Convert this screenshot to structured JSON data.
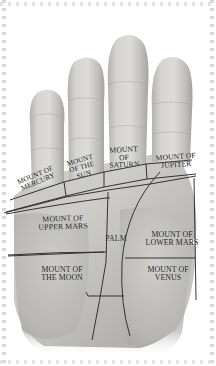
{
  "diagram": {
    "style": "grayscale photographic palm with labelled mount regions"
  },
  "colors": {
    "background": "#ffffff",
    "skin_light": "#d9d7d4",
    "skin_mid": "#bfbdba",
    "skin_shadow": "#a2a09d",
    "skin_deep": "#8c8a88",
    "line_stroke": "#2a2b30",
    "label_text": "#15161a",
    "frame_dot": "#d8d8dc"
  },
  "fingers": [
    {
      "name": "little-finger",
      "label": "pinky"
    },
    {
      "name": "ring-finger",
      "label": "ring"
    },
    {
      "name": "middle-finger",
      "label": "middle"
    },
    {
      "name": "index-finger",
      "label": "index"
    }
  ],
  "regions": [
    {
      "id": "mount-of-mercury",
      "label": "MOUNT OF\nMERCURY",
      "x": 8,
      "y": 172,
      "width": 58,
      "height": 26,
      "rotate": -23,
      "font_size": 7.2
    },
    {
      "id": "mount-of-the-sun",
      "label": "MOUNT\nOF THE\nSUN",
      "x": 62,
      "y": 157,
      "width": 40,
      "height": 36,
      "rotate": -16,
      "font_size": 7.2
    },
    {
      "id": "mount-of-saturn",
      "label": "MOUNT\nOF\nSATURN",
      "x": 102,
      "y": 146,
      "width": 44,
      "height": 38,
      "rotate": -3,
      "font_size": 7.6
    },
    {
      "id": "mount-of-jupiter",
      "label": "MOUNT OF\nJUPITER",
      "x": 143,
      "y": 153,
      "width": 66,
      "height": 26,
      "rotate": -4,
      "font_size": 7.6
    },
    {
      "id": "mount-of-upper-mars",
      "label": "MOUNT OF\nUPPER MARS",
      "x": 21,
      "y": 215,
      "width": 84,
      "height": 26,
      "rotate": -2,
      "font_size": 7.8
    },
    {
      "id": "palm",
      "label": "PALM",
      "x": 100,
      "y": 235,
      "width": 32,
      "height": 12,
      "rotate": 0,
      "font_size": 7.8
    },
    {
      "id": "mount-of-lower-mars",
      "label": "MOUNT OF\nLOWER MARS",
      "x": 131,
      "y": 231,
      "width": 82,
      "height": 26,
      "rotate": 0,
      "font_size": 7.8
    },
    {
      "id": "mount-of-the-moon",
      "label": "MOUNT OF\nTHE MOON",
      "x": 20,
      "y": 266,
      "width": 84,
      "height": 26,
      "rotate": 0,
      "font_size": 7.8
    },
    {
      "id": "mount-of-venus",
      "label": "MOUNT OF\nVENUS",
      "x": 128,
      "y": 266,
      "width": 80,
      "height": 26,
      "rotate": 0,
      "font_size": 7.8
    }
  ]
}
